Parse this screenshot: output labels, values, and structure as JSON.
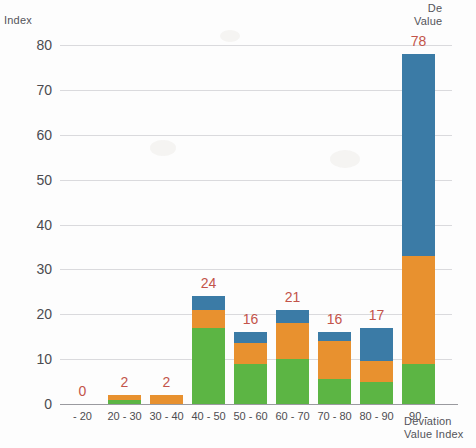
{
  "chart_data": {
    "type": "bar",
    "subtype": "stacked-bar",
    "title": "",
    "xlabel": "Deviation Value Index",
    "ylabel": "Index",
    "ylim": [
      0,
      80
    ],
    "ytick_step": 10,
    "yticks": [
      "0",
      "10",
      "20",
      "30",
      "40",
      "50",
      "60",
      "70",
      "80"
    ],
    "grid": true,
    "legend": "none",
    "categories": [
      "- 20",
      "20 - 30",
      "30 - 40",
      "40 - 50",
      "50 - 60",
      "60 - 70",
      "70 - 80",
      "80 - 90",
      "90 -"
    ],
    "totals": [
      0,
      2,
      2,
      24,
      16,
      21,
      16,
      17,
      78
    ],
    "data_labels": [
      "0",
      "2",
      "2",
      "24",
      "16",
      "21",
      "16",
      "17",
      "78"
    ],
    "series": [
      {
        "name": "green",
        "color": "#5cb544",
        "values": [
          0,
          1,
          0,
          17,
          9,
          10,
          5.5,
          5,
          9
        ]
      },
      {
        "name": "orange",
        "color": "#e8912f",
        "values": [
          0,
          1,
          2,
          4,
          4.5,
          8,
          8.5,
          4.5,
          24
        ]
      },
      {
        "name": "blue",
        "color": "#3b7ba6",
        "values": [
          0,
          0,
          0,
          3,
          2.5,
          3,
          2,
          7.5,
          45
        ]
      }
    ],
    "colors": {
      "green": "#5cb544",
      "orange": "#e8912f",
      "blue": "#3b7ba6",
      "data_label": "#c3544a",
      "gridline": "#dadadd",
      "axis_line": "#9a9a9f",
      "tick_text": "#4b4b50",
      "background": "#fdfdfd"
    },
    "corner_note": "De\nValue"
  }
}
